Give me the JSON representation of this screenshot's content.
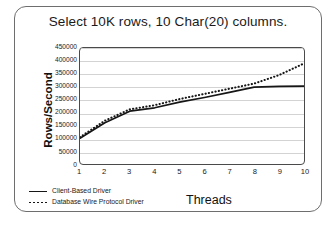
{
  "chart_data": {
    "type": "line",
    "title": "Select 10K rows, 10 Char(20) columns.",
    "xlabel": "Threads",
    "ylabel": "Rows/Second",
    "x": [
      1,
      2,
      3,
      4,
      5,
      6,
      7,
      8,
      9,
      10
    ],
    "xlim": [
      1,
      10
    ],
    "ylim": [
      0,
      450000
    ],
    "ytick_labels": [
      "450000",
      "400000",
      "350000",
      "300000",
      "250000",
      "200000",
      "150000",
      "100000",
      "50000",
      "0"
    ],
    "ytick_values": [
      450000,
      400000,
      350000,
      300000,
      250000,
      200000,
      150000,
      100000,
      50000,
      0
    ],
    "xtick_labels": [
      "1",
      "2",
      "3",
      "4",
      "5",
      "6",
      "7",
      "8",
      "9",
      "10"
    ],
    "grid": true,
    "legend_position": "bottom-left",
    "series": [
      {
        "name": "Client-Based Driver",
        "style": "solid",
        "color": "#161616",
        "values": [
          100000,
          160000,
          205000,
          218000,
          240000,
          258000,
          278000,
          298000,
          301000,
          302000
        ]
      },
      {
        "name": "Database Wire Protocol Driver",
        "style": "dotted",
        "color": "#161616",
        "values": [
          104000,
          168000,
          212000,
          228000,
          252000,
          272000,
          292000,
          312000,
          345000,
          390000
        ]
      }
    ]
  },
  "legend": {
    "items": [
      {
        "label": "Client-Based Driver",
        "style": "solid"
      },
      {
        "label": "Database Wire Protocol Driver",
        "style": "dotted"
      }
    ]
  }
}
